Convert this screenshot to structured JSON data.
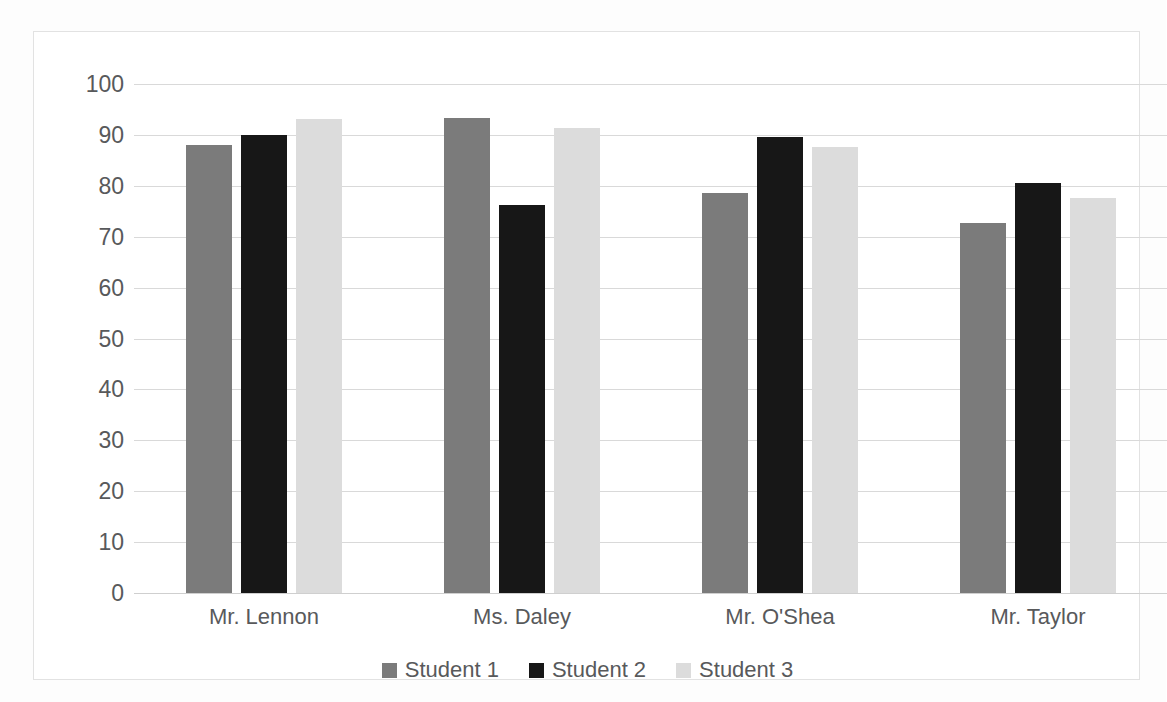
{
  "chart_data": {
    "type": "bar",
    "title": "",
    "subtitle": "",
    "xlabel": "",
    "ylabel": "",
    "ylim": [
      0,
      100
    ],
    "ytick_step": 10,
    "yticks": [
      "100",
      "90",
      "80",
      "70",
      "60",
      "50",
      "40",
      "30",
      "20",
      "10",
      "0"
    ],
    "grid": true,
    "legend_position": "bottom",
    "categories": [
      "Mr. Lennon",
      "Ms. Daley",
      "Mr. O'Shea",
      "Mr. Taylor"
    ],
    "series": [
      {
        "name": "Student 1",
        "color": "#7b7b7b",
        "values": [
          88,
          93.3,
          78.5,
          72.7
        ]
      },
      {
        "name": "Student 2",
        "color": "#171717",
        "values": [
          90,
          76.3,
          89.6,
          80.6
        ]
      },
      {
        "name": "Student 3",
        "color": "#dcdcdc",
        "values": [
          93.2,
          91.4,
          87.6,
          77.6
        ]
      }
    ]
  },
  "colors": {
    "background": "#ffffff",
    "frame_border": "#e2e2e2",
    "gridline": "#d9d9d9",
    "axis_text": "#58595b",
    "series_1": "#7b7b7b",
    "series_2": "#171717",
    "series_3": "#dcdcdc"
  }
}
